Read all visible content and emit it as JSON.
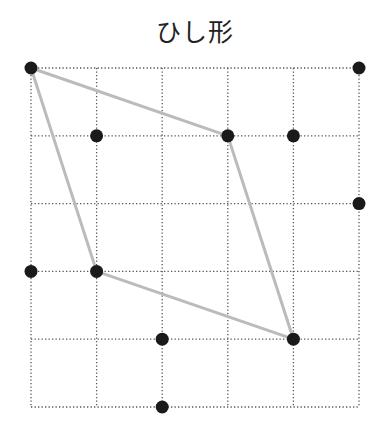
{
  "title": "ひし形",
  "grid": {
    "cols": 5,
    "rows": 5,
    "origin_x": 31,
    "origin_y": 68,
    "cell_w": 65.6,
    "cell_h": 67.8,
    "line_color": "#555555"
  },
  "dots": [
    {
      "col": 0,
      "row": 0
    },
    {
      "col": 5,
      "row": 0
    },
    {
      "col": 1,
      "row": 1
    },
    {
      "col": 3,
      "row": 1
    },
    {
      "col": 4,
      "row": 1
    },
    {
      "col": 5,
      "row": 2
    },
    {
      "col": 0,
      "row": 3
    },
    {
      "col": 1,
      "row": 3
    },
    {
      "col": 2,
      "row": 4
    },
    {
      "col": 4,
      "row": 4
    },
    {
      "col": 2,
      "row": 5
    }
  ],
  "dot_color": "#1a1a1a",
  "rhombus": {
    "vertices": [
      {
        "col": 0,
        "row": 0
      },
      {
        "col": 3,
        "row": 1
      },
      {
        "col": 4,
        "row": 4
      },
      {
        "col": 1,
        "row": 3
      }
    ],
    "stroke_color": "#bbbbbb"
  }
}
